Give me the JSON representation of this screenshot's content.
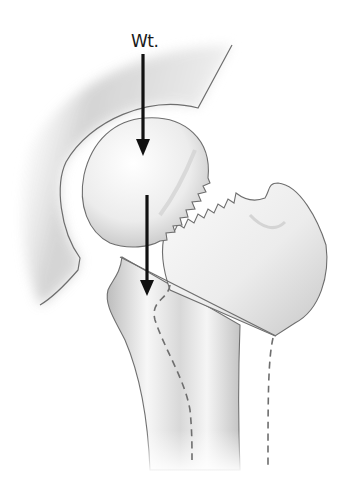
{
  "figure": {
    "labels": {
      "weight": "Wt."
    },
    "structures": [
      {
        "id": "acetabulum",
        "name": "Acetabulum (pelvis)"
      },
      {
        "id": "femoral-head",
        "name": "Femoral head"
      },
      {
        "id": "fracture-line-jagged",
        "name": "Subcapital fracture (serrated)"
      },
      {
        "id": "greater-trochanter-fragment",
        "name": "Greater trochanter / neck fragment"
      },
      {
        "id": "osteotomy-line",
        "name": "Oblique osteotomy plane"
      },
      {
        "id": "femoral-shaft",
        "name": "Femoral shaft"
      },
      {
        "id": "medullary-canal-lines",
        "name": "Dashed cortical outlines"
      }
    ],
    "arrows": [
      {
        "id": "weight-arrow-upper",
        "direction": "down"
      },
      {
        "id": "weight-arrow-lower",
        "direction": "down"
      }
    ],
    "colors": {
      "outline": "#6e6e6e",
      "bone_light": "#f1f1f1",
      "bone_shade": "#bdbdbd",
      "arrow": "#111111",
      "background": "#ffffff"
    }
  }
}
